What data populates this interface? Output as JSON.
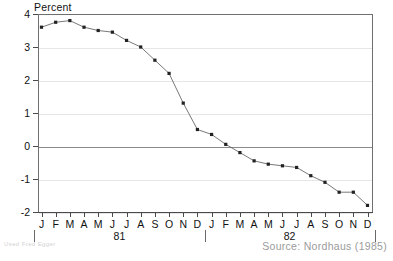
{
  "axis": {
    "y_title": "Percent",
    "y_ticks": [
      4,
      3,
      2,
      1,
      0,
      -1,
      -2
    ],
    "y_tick_labels": [
      "4",
      "3",
      "2",
      "1",
      "0",
      "-1",
      "-2"
    ],
    "month_labels": [
      "J",
      "F",
      "M",
      "A",
      "M",
      "J",
      "J",
      "A",
      "S",
      "O",
      "N",
      "D"
    ],
    "year_labels": [
      "81",
      "82"
    ]
  },
  "footer": {
    "source": "Source: Nordhaus (1985)",
    "watermark": "Used Fred Egger"
  },
  "colors": {
    "line": "#555555",
    "marker": "#222222",
    "axis": "#4a4a4a",
    "grid": "#e6e6e6",
    "zero": "#8a8a8a",
    "text": "#111111",
    "source_text": "#9b9b9b"
  },
  "chart_data": {
    "type": "line",
    "title": "",
    "subtitle": "",
    "xlabel": "",
    "ylabel": "Percent",
    "ylim": [
      -2,
      4
    ],
    "grid": true,
    "legend": "none",
    "x": [
      "1981-J",
      "1981-F",
      "1981-M",
      "1981-A",
      "1981-M",
      "1981-J",
      "1981-J",
      "1981-A",
      "1981-S",
      "1981-O",
      "1981-N",
      "1981-D",
      "1982-J",
      "1982-F",
      "1982-M",
      "1982-A",
      "1982-M",
      "1982-J",
      "1982-J",
      "1982-A",
      "1982-S",
      "1982-O",
      "1982-N",
      "1982-D"
    ],
    "tick_labels": [
      "J",
      "F",
      "M",
      "A",
      "M",
      "J",
      "J",
      "A",
      "S",
      "O",
      "N",
      "D",
      "J",
      "F",
      "M",
      "A",
      "M",
      "J",
      "J",
      "A",
      "S",
      "O",
      "N",
      "D"
    ],
    "values": [
      3.6,
      3.75,
      3.8,
      3.6,
      3.5,
      3.45,
      3.2,
      3.0,
      2.6,
      2.2,
      1.3,
      0.5,
      0.35,
      0.05,
      -0.2,
      -0.45,
      -0.55,
      -0.6,
      -0.65,
      -0.9,
      -1.1,
      -1.4,
      -1.4,
      -1.8
    ],
    "series": [
      {
        "name": "Percent",
        "values": [
          3.6,
          3.75,
          3.8,
          3.6,
          3.5,
          3.45,
          3.2,
          3.0,
          2.6,
          2.2,
          1.3,
          0.5,
          0.35,
          0.05,
          -0.2,
          -0.45,
          -0.55,
          -0.6,
          -0.65,
          -0.9,
          -1.1,
          -1.4,
          -1.4,
          -1.8
        ],
        "marker": "square",
        "color": "#555555"
      }
    ],
    "annotations": [
      "Source: Nordhaus (1985)"
    ]
  }
}
